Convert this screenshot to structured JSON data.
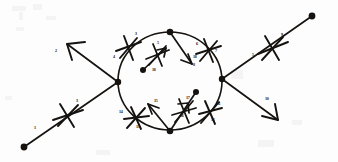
{
  "figure": {
    "background_color": "#fdfdfd",
    "ink_color": "#15120f",
    "width": 338,
    "height": 162
  },
  "nodes": [
    {
      "name": "endpoint-lower-left",
      "x": 24,
      "y": 147
    },
    {
      "name": "vertex-left",
      "x": 118,
      "y": 82
    },
    {
      "name": "vertex-top",
      "x": 170,
      "y": 32
    },
    {
      "name": "vertex-right",
      "x": 222,
      "y": 79
    },
    {
      "name": "vertex-bottom",
      "x": 170,
      "y": 131
    },
    {
      "name": "endpoint-upper-right",
      "x": 312,
      "y": 16
    },
    {
      "name": "interior-dot-upper",
      "x": 143,
      "y": 70
    },
    {
      "name": "interior-dot-lower",
      "x": 196,
      "y": 92
    }
  ],
  "circle": {
    "cx": 170,
    "cy": 81,
    "rx": 52,
    "ry": 49
  },
  "labels": [
    {
      "id": "1",
      "x": 34,
      "y": 128
    },
    {
      "id": "2",
      "x": 55,
      "y": 51
    },
    {
      "id": "3",
      "x": 76,
      "y": 101
    },
    {
      "id": "3b",
      "text": "3",
      "x": 135,
      "y": 34
    },
    {
      "id": "4",
      "x": 113,
      "y": 57
    },
    {
      "id": "5",
      "x": 157,
      "y": 43
    },
    {
      "id": "5b",
      "text": "5",
      "x": 252,
      "y": 55
    },
    {
      "id": "6",
      "x": 196,
      "y": 44
    },
    {
      "id": "7",
      "x": 215,
      "y": 51
    },
    {
      "id": "8",
      "x": 193,
      "y": 65
    },
    {
      "id": "9",
      "x": 281,
      "y": 35
    },
    {
      "id": "10",
      "x": 265,
      "y": 99
    },
    {
      "id": "11",
      "x": 217,
      "y": 104
    },
    {
      "id": "12",
      "x": 211,
      "y": 120
    },
    {
      "id": "13",
      "x": 136,
      "y": 127
    },
    {
      "id": "14",
      "x": 119,
      "y": 112
    },
    {
      "id": "15",
      "x": 154,
      "y": 101
    },
    {
      "id": "16",
      "x": 180,
      "y": 116
    },
    {
      "id": "17",
      "x": 186,
      "y": 98
    },
    {
      "id": "18",
      "x": 152,
      "y": 70
    },
    {
      "id": "18b",
      "text": "18",
      "x": 193,
      "y": 57
    }
  ],
  "tick_marks": [
    {
      "name": "tick-lower-left-strand",
      "x": 67,
      "y": 115
    },
    {
      "name": "tick-upper-left-circle",
      "x": 128,
      "y": 47
    },
    {
      "name": "tick-inner-upper",
      "x": 157,
      "y": 55
    },
    {
      "name": "tick-upper-right-circle",
      "x": 208,
      "y": 50
    },
    {
      "name": "tick-upper-right-strand",
      "x": 272,
      "y": 48
    },
    {
      "name": "tick-lower-left-circle",
      "x": 136,
      "y": 118
    },
    {
      "name": "tick-inner-lower",
      "x": 184,
      "y": 112
    },
    {
      "name": "tick-lower-right-circle",
      "x": 210,
      "y": 112
    }
  ],
  "arrows": [
    {
      "name": "arrow-upper-left-outgoing"
    },
    {
      "name": "arrow-lower-right-outgoing"
    },
    {
      "name": "arrow-interior-upper"
    },
    {
      "name": "arrow-interior-downward"
    },
    {
      "name": "arrow-interior-lower-left"
    },
    {
      "name": "arrow-interior-lower-right"
    }
  ]
}
